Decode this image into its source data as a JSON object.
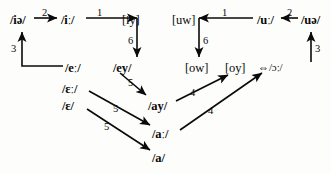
{
  "diagram": {
    "stroke_color": "#0a0a0a",
    "background_color": "#fdfdfb",
    "nodes": [
      {
        "id": "ie",
        "label": "/iə/",
        "x": 10,
        "y": 14,
        "style": "slash"
      },
      {
        "id": "ii",
        "label": "/iː/",
        "x": 61,
        "y": 14,
        "style": "slash"
      },
      {
        "id": "iy",
        "label": "[iy]",
        "x": 122,
        "y": 14,
        "style": "bracket"
      },
      {
        "id": "uw",
        "label": "[uw]",
        "x": 172,
        "y": 14,
        "style": "bracket"
      },
      {
        "id": "uu",
        "label": "/uː/",
        "x": 257,
        "y": 14,
        "style": "slash"
      },
      {
        "id": "ue",
        "label": "/uə/",
        "x": 301,
        "y": 14,
        "style": "slash"
      },
      {
        "id": "ee",
        "label": "/eː/",
        "x": 65,
        "y": 62,
        "style": "slash"
      },
      {
        "id": "ey",
        "label": "/ey/",
        "x": 113,
        "y": 62,
        "style": "slash"
      },
      {
        "id": "ow",
        "label": "[ow]",
        "x": 185,
        "y": 62,
        "style": "bracket"
      },
      {
        "id": "oy",
        "label": "[oy]",
        "x": 225,
        "y": 62,
        "style": "bracket"
      },
      {
        "id": "oo",
        "label": "⇔/ɔː/",
        "x": 258,
        "y": 62,
        "style": "double"
      },
      {
        "id": "EE",
        "label": "/ɛː/",
        "x": 62,
        "y": 83,
        "style": "slash"
      },
      {
        "id": "E",
        "label": "/ɛ/",
        "x": 62,
        "y": 100,
        "style": "slash"
      },
      {
        "id": "ay",
        "label": "/ay/",
        "x": 148,
        "y": 100,
        "style": "slash"
      },
      {
        "id": "aa",
        "label": "/aː/",
        "x": 152,
        "y": 128,
        "style": "slash"
      },
      {
        "id": "a",
        "label": "/a/",
        "x": 152,
        "y": 152,
        "style": "slash"
      }
    ],
    "edges": [
      {
        "from": "ie",
        "to": "ii",
        "label": "2",
        "lx": 42,
        "ly": 8,
        "kind": "horizontal-right"
      },
      {
        "from": "ii",
        "to": "iy",
        "label": "1",
        "lx": 97,
        "ly": 8,
        "kind": "horizontal-right-corner"
      },
      {
        "from": "iy",
        "to": "ey",
        "label": "6",
        "lx": 137,
        "ly": 38,
        "kind": "vertical-down"
      },
      {
        "from": "ee",
        "to": "ie",
        "label": "3",
        "lx": 12,
        "ly": 44,
        "kind": "elbow-left-up"
      },
      {
        "from": "ue",
        "to": "uu",
        "label": "2",
        "lx": 287,
        "ly": 8,
        "kind": "horizontal-left"
      },
      {
        "from": "uu",
        "to": "uw",
        "label": "1",
        "lx": 222,
        "ly": 8,
        "kind": "horizontal-left-corner"
      },
      {
        "from": "uw",
        "to": "ow",
        "label": "6",
        "lx": 199,
        "ly": 38,
        "kind": "vertical-down"
      },
      {
        "from": "oo",
        "to": "ue",
        "label": "3",
        "lx": 311,
        "ly": 44,
        "kind": "vertical-up"
      },
      {
        "from": "ey",
        "to": "ay",
        "label": "5",
        "lx": 128,
        "ly": 78,
        "kind": "diagonal-down-right"
      },
      {
        "from": "ay",
        "to": "oy",
        "label": "4",
        "lx": 190,
        "ly": 88,
        "kind": "diagonal-up-right"
      },
      {
        "from": "EE",
        "to": "aa",
        "label": "5",
        "lx": 113,
        "ly": 104,
        "kind": "diagonal-down-right"
      },
      {
        "from": "aa",
        "to": "oo",
        "label": "4",
        "lx": 208,
        "ly": 106,
        "kind": "diagonal-up-right"
      },
      {
        "from": "E",
        "to": "a",
        "label": "5",
        "lx": 104,
        "ly": 122,
        "kind": "diagonal-down-right"
      }
    ]
  }
}
